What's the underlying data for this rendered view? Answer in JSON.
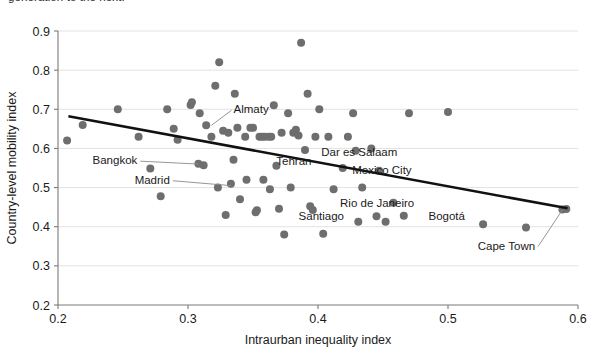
{
  "figure": {
    "clipped_caption_above": "generation to the next."
  },
  "chart_data": {
    "type": "scatter",
    "title": "",
    "xlabel": "Intraurban inequality index",
    "ylabel": "Country-level mobility index",
    "xlim": [
      0.2,
      0.6
    ],
    "ylim": [
      0.2,
      0.9
    ],
    "xticks": [
      "0.2",
      "0.3",
      "0.4",
      "0.5",
      "0.6"
    ],
    "yticks": [
      "0.2",
      "0.3",
      "0.4",
      "0.5",
      "0.6",
      "0.7",
      "0.8",
      "0.9"
    ],
    "grid": "horizontal",
    "legend": "none",
    "marker_color": "#6e6e6e",
    "trendline_color": "#111111",
    "trendline": {
      "type": "linear-fit",
      "x_start": 0.208,
      "y_start": 0.682,
      "x_end": 0.592,
      "y_end": 0.447
    },
    "points": [
      {
        "x": 0.207,
        "y": 0.62
      },
      {
        "x": 0.219,
        "y": 0.66
      },
      {
        "x": 0.246,
        "y": 0.7
      },
      {
        "x": 0.262,
        "y": 0.63
      },
      {
        "x": 0.271,
        "y": 0.549
      },
      {
        "x": 0.279,
        "y": 0.478
      },
      {
        "x": 0.284,
        "y": 0.7
      },
      {
        "x": 0.289,
        "y": 0.65
      },
      {
        "x": 0.292,
        "y": 0.622
      },
      {
        "x": 0.302,
        "y": 0.711
      },
      {
        "x": 0.303,
        "y": 0.718
      },
      {
        "x": 0.309,
        "y": 0.69
      },
      {
        "x": 0.308,
        "y": 0.561
      },
      {
        "x": 0.312,
        "y": 0.557
      },
      {
        "x": 0.314,
        "y": 0.659
      },
      {
        "x": 0.318,
        "y": 0.63
      },
      {
        "x": 0.321,
        "y": 0.76
      },
      {
        "x": 0.323,
        "y": 0.5
      },
      {
        "x": 0.324,
        "y": 0.82
      },
      {
        "x": 0.327,
        "y": 0.645
      },
      {
        "x": 0.329,
        "y": 0.43
      },
      {
        "x": 0.331,
        "y": 0.64
      },
      {
        "x": 0.333,
        "y": 0.51
      },
      {
        "x": 0.335,
        "y": 0.571
      },
      {
        "x": 0.336,
        "y": 0.74
      },
      {
        "x": 0.338,
        "y": 0.653
      },
      {
        "x": 0.34,
        "y": 0.47
      },
      {
        "x": 0.344,
        "y": 0.63
      },
      {
        "x": 0.345,
        "y": 0.52
      },
      {
        "x": 0.348,
        "y": 0.653
      },
      {
        "x": 0.35,
        "y": 0.653
      },
      {
        "x": 0.352,
        "y": 0.437
      },
      {
        "x": 0.353,
        "y": 0.442
      },
      {
        "x": 0.355,
        "y": 0.63
      },
      {
        "x": 0.357,
        "y": 0.63
      },
      {
        "x": 0.359,
        "y": 0.63
      },
      {
        "x": 0.358,
        "y": 0.52
      },
      {
        "x": 0.362,
        "y": 0.63
      },
      {
        "x": 0.363,
        "y": 0.496
      },
      {
        "x": 0.364,
        "y": 0.63
      },
      {
        "x": 0.366,
        "y": 0.71
      },
      {
        "x": 0.368,
        "y": 0.556
      },
      {
        "x": 0.37,
        "y": 0.446
      },
      {
        "x": 0.372,
        "y": 0.64
      },
      {
        "x": 0.374,
        "y": 0.38
      },
      {
        "x": 0.377,
        "y": 0.69
      },
      {
        "x": 0.379,
        "y": 0.5
      },
      {
        "x": 0.381,
        "y": 0.64
      },
      {
        "x": 0.383,
        "y": 0.648
      },
      {
        "x": 0.385,
        "y": 0.633
      },
      {
        "x": 0.387,
        "y": 0.87
      },
      {
        "x": 0.39,
        "y": 0.596
      },
      {
        "x": 0.392,
        "y": 0.74
      },
      {
        "x": 0.394,
        "y": 0.452
      },
      {
        "x": 0.396,
        "y": 0.443
      },
      {
        "x": 0.398,
        "y": 0.63
      },
      {
        "x": 0.401,
        "y": 0.7
      },
      {
        "x": 0.404,
        "y": 0.382
      },
      {
        "x": 0.408,
        "y": 0.63
      },
      {
        "x": 0.412,
        "y": 0.496
      },
      {
        "x": 0.419,
        "y": 0.55
      },
      {
        "x": 0.423,
        "y": 0.63
      },
      {
        "x": 0.427,
        "y": 0.69
      },
      {
        "x": 0.429,
        "y": 0.594
      },
      {
        "x": 0.431,
        "y": 0.413
      },
      {
        "x": 0.434,
        "y": 0.5
      },
      {
        "x": 0.441,
        "y": 0.6
      },
      {
        "x": 0.445,
        "y": 0.427
      },
      {
        "x": 0.447,
        "y": 0.543
      },
      {
        "x": 0.452,
        "y": 0.413
      },
      {
        "x": 0.458,
        "y": 0.461
      },
      {
        "x": 0.466,
        "y": 0.428
      },
      {
        "x": 0.47,
        "y": 0.69
      },
      {
        "x": 0.5,
        "y": 0.693
      },
      {
        "x": 0.527,
        "y": 0.406
      },
      {
        "x": 0.56,
        "y": 0.398
      },
      {
        "x": 0.588,
        "y": 0.444
      },
      {
        "x": 0.591,
        "y": 0.445
      }
    ],
    "annotations": [
      {
        "label": "Almaty",
        "x": 0.335,
        "y": 0.7,
        "point_x": 0.318,
        "point_y": 0.659,
        "leader": true
      },
      {
        "label": "Bangkok",
        "x": 0.261,
        "y": 0.57,
        "point_x": 0.308,
        "point_y": 0.56,
        "leader": true
      },
      {
        "label": "Madrid",
        "x": 0.286,
        "y": 0.52,
        "point_x": 0.333,
        "point_y": 0.505,
        "leader": true
      },
      {
        "label": "Tehran",
        "x": 0.395,
        "y": 0.568,
        "point_x": 0.413,
        "point_y": 0.555,
        "leader": false
      },
      {
        "label": "Dar es Salaam",
        "x": 0.461,
        "y": 0.591,
        "point_x": 0.429,
        "point_y": 0.594,
        "leader": false
      },
      {
        "label": "Mexico City",
        "x": 0.472,
        "y": 0.544,
        "point_x": 0.447,
        "point_y": 0.543,
        "leader": false
      },
      {
        "label": "Rio de Janeiro",
        "x": 0.474,
        "y": 0.461,
        "point_x": 0.458,
        "point_y": 0.461,
        "leader": false
      },
      {
        "label": "Santiago",
        "x": 0.42,
        "y": 0.428,
        "point_x": 0.445,
        "point_y": 0.427,
        "leader": false
      },
      {
        "label": "Bogotá",
        "x": 0.485,
        "y": 0.428,
        "point_x": 0.466,
        "point_y": 0.428,
        "leader": false
      },
      {
        "label": "Cape Town",
        "x": 0.567,
        "y": 0.352,
        "point_x": 0.588,
        "point_y": 0.443,
        "leader": true
      }
    ]
  }
}
